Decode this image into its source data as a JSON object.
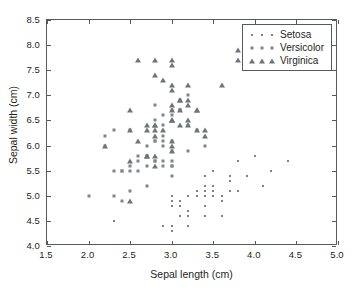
{
  "chart_data": {
    "type": "scatter",
    "title": "",
    "xlabel": "Sepal length (cm)",
    "ylabel": "Sepal width (cm)",
    "xlim": [
      1.5,
      5.0
    ],
    "ylim": [
      4.0,
      8.5
    ],
    "xticks": [
      "1.5",
      "2.0",
      "2.5",
      "3.0",
      "3.5",
      "4.0",
      "4.5",
      "5.0"
    ],
    "yticks": [
      "4.0",
      "4.5",
      "5.0",
      "5.5",
      "6.0",
      "6.5",
      "7.0",
      "7.5",
      "8.0",
      "8.5"
    ],
    "xtick_values": [
      1.5,
      2.0,
      2.5,
      3.0,
      3.5,
      4.0,
      4.5,
      5.0
    ],
    "ytick_values": [
      4.0,
      4.5,
      5.0,
      5.5,
      6.0,
      6.5,
      7.0,
      7.5,
      8.0,
      8.5
    ],
    "grid": false,
    "legend_position": "top-right",
    "marker_color": "#7d8288",
    "axis_color": "#555a5e",
    "series": [
      {
        "name": "Setosa",
        "marker": "small-dot",
        "points": [
          [
            3.5,
            5.1
          ],
          [
            3.0,
            4.9
          ],
          [
            3.2,
            4.7
          ],
          [
            3.1,
            4.6
          ],
          [
            3.6,
            5.0
          ],
          [
            3.9,
            5.4
          ],
          [
            3.4,
            4.6
          ],
          [
            3.4,
            5.0
          ],
          [
            2.9,
            4.4
          ],
          [
            3.1,
            4.9
          ],
          [
            3.7,
            5.4
          ],
          [
            3.4,
            4.8
          ],
          [
            3.0,
            4.8
          ],
          [
            3.0,
            4.3
          ],
          [
            4.0,
            5.8
          ],
          [
            4.4,
            5.7
          ],
          [
            3.9,
            5.4
          ],
          [
            3.5,
            5.1
          ],
          [
            3.8,
            5.7
          ],
          [
            3.8,
            5.1
          ],
          [
            3.4,
            5.4
          ],
          [
            3.7,
            5.1
          ],
          [
            3.6,
            4.6
          ],
          [
            3.3,
            5.1
          ],
          [
            3.4,
            4.8
          ],
          [
            3.0,
            5.0
          ],
          [
            3.4,
            5.0
          ],
          [
            3.5,
            5.2
          ],
          [
            3.4,
            5.2
          ],
          [
            3.2,
            4.7
          ],
          [
            3.1,
            4.8
          ],
          [
            3.4,
            5.4
          ],
          [
            4.1,
            5.2
          ],
          [
            4.2,
            5.5
          ],
          [
            3.1,
            4.9
          ],
          [
            3.2,
            5.0
          ],
          [
            3.5,
            5.5
          ],
          [
            3.6,
            4.9
          ],
          [
            3.0,
            4.4
          ],
          [
            3.4,
            5.1
          ],
          [
            3.5,
            5.0
          ],
          [
            2.3,
            4.5
          ],
          [
            3.2,
            4.4
          ],
          [
            3.5,
            5.0
          ],
          [
            3.8,
            5.1
          ],
          [
            3.0,
            4.8
          ],
          [
            3.8,
            5.1
          ],
          [
            3.2,
            4.6
          ],
          [
            3.7,
            5.3
          ],
          [
            3.3,
            5.0
          ]
        ]
      },
      {
        "name": "Versicolor",
        "marker": "medium-dot",
        "points": [
          [
            3.2,
            7.0
          ],
          [
            3.2,
            6.4
          ],
          [
            3.1,
            6.9
          ],
          [
            2.3,
            5.5
          ],
          [
            2.8,
            6.5
          ],
          [
            2.8,
            5.7
          ],
          [
            3.3,
            6.3
          ],
          [
            2.4,
            4.9
          ],
          [
            2.9,
            6.6
          ],
          [
            2.7,
            5.2
          ],
          [
            2.0,
            5.0
          ],
          [
            3.0,
            5.9
          ],
          [
            2.2,
            6.0
          ],
          [
            2.9,
            6.1
          ],
          [
            2.9,
            5.6
          ],
          [
            3.1,
            6.7
          ],
          [
            3.0,
            5.6
          ],
          [
            2.7,
            5.8
          ],
          [
            2.2,
            6.2
          ],
          [
            2.5,
            5.6
          ],
          [
            3.2,
            5.9
          ],
          [
            2.8,
            6.1
          ],
          [
            2.5,
            6.3
          ],
          [
            2.8,
            6.1
          ],
          [
            2.9,
            6.4
          ],
          [
            3.0,
            6.6
          ],
          [
            2.8,
            6.8
          ],
          [
            3.0,
            6.7
          ],
          [
            2.9,
            6.0
          ],
          [
            2.6,
            5.7
          ],
          [
            2.4,
            5.5
          ],
          [
            2.4,
            5.5
          ],
          [
            2.7,
            5.8
          ],
          [
            2.7,
            6.0
          ],
          [
            3.0,
            5.4
          ],
          [
            3.4,
            6.0
          ],
          [
            3.1,
            6.7
          ],
          [
            2.3,
            6.3
          ],
          [
            3.0,
            5.6
          ],
          [
            2.5,
            5.5
          ],
          [
            2.6,
            5.5
          ],
          [
            3.0,
            6.1
          ],
          [
            2.6,
            5.8
          ],
          [
            2.3,
            5.0
          ],
          [
            2.7,
            5.6
          ],
          [
            3.0,
            5.7
          ],
          [
            2.9,
            5.7
          ],
          [
            2.9,
            6.2
          ],
          [
            2.5,
            5.1
          ],
          [
            2.8,
            5.7
          ]
        ]
      },
      {
        "name": "Virginica",
        "marker": "triangle",
        "points": [
          [
            3.3,
            6.3
          ],
          [
            2.7,
            5.8
          ],
          [
            3.0,
            7.1
          ],
          [
            2.9,
            6.3
          ],
          [
            3.0,
            6.5
          ],
          [
            3.0,
            7.6
          ],
          [
            2.5,
            4.9
          ],
          [
            2.9,
            7.3
          ],
          [
            2.5,
            6.7
          ],
          [
            3.6,
            7.2
          ],
          [
            3.2,
            6.5
          ],
          [
            2.7,
            6.4
          ],
          [
            3.0,
            6.8
          ],
          [
            2.5,
            5.7
          ],
          [
            2.8,
            5.8
          ],
          [
            3.2,
            6.4
          ],
          [
            3.0,
            6.5
          ],
          [
            3.8,
            7.7
          ],
          [
            2.6,
            7.7
          ],
          [
            2.2,
            6.0
          ],
          [
            3.2,
            6.9
          ],
          [
            2.8,
            5.6
          ],
          [
            2.8,
            7.7
          ],
          [
            2.7,
            6.3
          ],
          [
            3.3,
            6.7
          ],
          [
            3.2,
            7.2
          ],
          [
            2.8,
            6.2
          ],
          [
            3.0,
            6.1
          ],
          [
            2.8,
            6.4
          ],
          [
            3.0,
            7.2
          ],
          [
            2.8,
            7.4
          ],
          [
            3.8,
            7.9
          ],
          [
            2.8,
            6.4
          ],
          [
            2.8,
            6.3
          ],
          [
            2.6,
            6.1
          ],
          [
            3.0,
            7.7
          ],
          [
            3.4,
            6.3
          ],
          [
            3.1,
            6.4
          ],
          [
            3.0,
            6.0
          ],
          [
            3.1,
            6.9
          ],
          [
            3.1,
            6.7
          ],
          [
            3.1,
            6.9
          ],
          [
            2.7,
            5.8
          ],
          [
            3.2,
            6.8
          ],
          [
            3.3,
            6.7
          ],
          [
            3.0,
            6.7
          ],
          [
            2.5,
            6.3
          ],
          [
            3.0,
            6.5
          ],
          [
            3.4,
            6.2
          ],
          [
            3.0,
            5.9
          ]
        ]
      }
    ]
  },
  "legend": {
    "entries": [
      {
        "label": "Setosa",
        "marker": "small-dot"
      },
      {
        "label": "Versicolor",
        "marker": "medium-dot"
      },
      {
        "label": "Virginica",
        "marker": "triangle"
      }
    ]
  }
}
